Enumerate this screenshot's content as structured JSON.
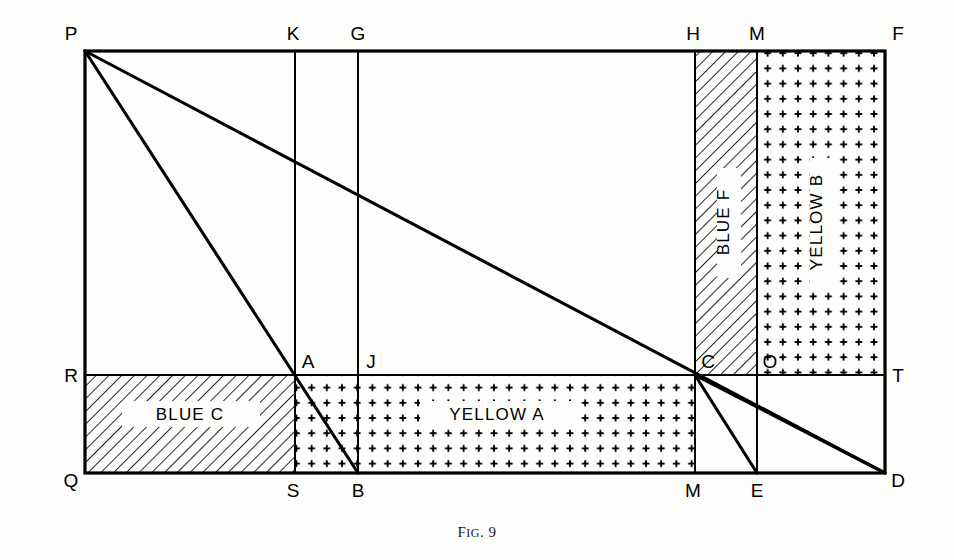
{
  "figure": {
    "caption_prefix": "F",
    "caption_smallcaps": "IG",
    "caption_suffix": ". 9",
    "caption_full": "FIG. 9",
    "background_color": "#fdfdfb",
    "ink_color": "#000000"
  },
  "frame": {
    "left": 85,
    "top": 51,
    "right": 885,
    "bottom": 473,
    "midline_y": 375,
    "stroke_outer": 3.2,
    "stroke_inner": 2.0,
    "stroke_diagonal": 3.0
  },
  "verticals": [
    {
      "name": "KS",
      "x": 295,
      "top": 51,
      "bottom": 473
    },
    {
      "name": "GB",
      "x": 358,
      "top": 51,
      "bottom": 473
    },
    {
      "name": "HM",
      "x": 695,
      "top": 51,
      "bottom": 473
    },
    {
      "name": "MOE",
      "x": 757,
      "top": 51,
      "bottom": 473
    }
  ],
  "diagonals": [
    {
      "name": "P-B",
      "x1": 85,
      "y1": 51,
      "x2": 358,
      "y2": 473
    },
    {
      "name": "P-D",
      "x1": 85,
      "y1": 51,
      "x2": 885,
      "y2": 473
    },
    {
      "name": "C-E",
      "x1": 695,
      "y1": 375,
      "x2": 757,
      "y2": 473
    },
    {
      "name": "C-D",
      "x1": 695,
      "y1": 375,
      "x2": 885,
      "y2": 473
    }
  ],
  "regions": [
    {
      "id": "blue-c",
      "label": "BLUE  C",
      "fill": "hatch",
      "orientation": "horizontal",
      "x": 85,
      "y": 375,
      "width": 210,
      "height": 98,
      "label_x": 190,
      "label_y": 414
    },
    {
      "id": "yellow-a",
      "label": "YELLOW  A",
      "fill": "plus",
      "orientation": "horizontal",
      "x": 295,
      "y": 375,
      "width": 400,
      "height": 98,
      "label_x": 497,
      "label_y": 414
    },
    {
      "id": "blue-f",
      "label": "BLUE  F",
      "fill": "hatch",
      "orientation": "vertical",
      "x": 695,
      "y": 51,
      "width": 62,
      "height": 324,
      "label_x": 729,
      "label_y": 222
    },
    {
      "id": "yellow-b",
      "label": "YELLOW  B",
      "fill": "plus",
      "orientation": "vertical",
      "x": 757,
      "y": 51,
      "width": 128,
      "height": 324,
      "label_x": 822,
      "label_y": 222
    }
  ],
  "vertex_labels": [
    {
      "text": "P",
      "x": 71,
      "y": 33,
      "anchor": "middle"
    },
    {
      "text": "K",
      "x": 293,
      "y": 33,
      "anchor": "middle"
    },
    {
      "text": "G",
      "x": 358,
      "y": 33,
      "anchor": "middle"
    },
    {
      "text": "H",
      "x": 693,
      "y": 33,
      "anchor": "middle"
    },
    {
      "text": "M",
      "x": 757,
      "y": 33,
      "anchor": "middle"
    },
    {
      "text": "F",
      "x": 898,
      "y": 33,
      "anchor": "middle"
    },
    {
      "text": "R",
      "x": 71,
      "y": 381,
      "anchor": "middle"
    },
    {
      "text": "A",
      "x": 307,
      "y": 367,
      "anchor": "middle"
    },
    {
      "text": "J",
      "x": 370,
      "y": 367,
      "anchor": "middle"
    },
    {
      "text": "C",
      "x": 707,
      "y": 367,
      "anchor": "middle"
    },
    {
      "text": "O",
      "x": 769,
      "y": 367,
      "anchor": "middle"
    },
    {
      "text": "T",
      "x": 898,
      "y": 367,
      "anchor": "middle"
    },
    {
      "text": "Q",
      "x": 71,
      "y": 490,
      "anchor": "middle"
    },
    {
      "text": "S",
      "x": 293,
      "y": 497,
      "anchor": "middle"
    },
    {
      "text": "B",
      "x": 358,
      "y": 497,
      "anchor": "middle"
    },
    {
      "text": "M",
      "x": 693,
      "y": 497,
      "anchor": "middle"
    },
    {
      "text": "E",
      "x": 757,
      "y": 497,
      "anchor": "middle"
    },
    {
      "text": "D",
      "x": 898,
      "y": 490,
      "anchor": "middle"
    }
  ],
  "patterns": {
    "hatch_spacing": 9,
    "hatch_stroke": 1.6,
    "plus_spacing": 15.2,
    "plus_arm": 3.2,
    "plus_stroke": 1.9
  }
}
